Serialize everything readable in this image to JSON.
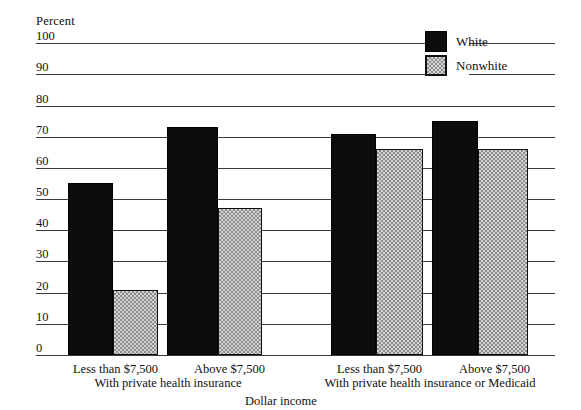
{
  "chart_data": {
    "type": "bar",
    "title": "",
    "subtitle": "",
    "xlabel": "Dollar income",
    "ylabel": "Percent",
    "ylim": [
      0,
      100
    ],
    "yticks": [
      100,
      90,
      80,
      70,
      60,
      50,
      40,
      30,
      20,
      10,
      0
    ],
    "ytick_labels": [
      "100",
      "90",
      "80",
      "70",
      "60",
      "50",
      "40",
      "30",
      "20",
      "10",
      "0"
    ],
    "grid": "horizontal",
    "legend_position": "top-right",
    "categories": [
      "Less than $7,500",
      "Above $7,500",
      "Less than $7,500",
      "Above $7,500"
    ],
    "groups": [
      {
        "label": "With private health insurance",
        "categories": [
          "Less than $7,500",
          "Above $7,500"
        ]
      },
      {
        "label": "With private health insurance or Medicaid",
        "categories": [
          "Less than $7,500",
          "Above $7,500"
        ]
      }
    ],
    "series": [
      {
        "name": "White",
        "color": "#0d0d0d",
        "pattern": "solid",
        "values": [
          55,
          73,
          71,
          75
        ]
      },
      {
        "name": "Nonwhite",
        "color": "#d2d2d2",
        "pattern": "checkered",
        "values": [
          21,
          47,
          66,
          66
        ]
      }
    ]
  },
  "legend": {
    "items": [
      {
        "label": "White",
        "swatch": "solid-black-swatch"
      },
      {
        "label": "Nonwhite",
        "swatch": "checkered-gray-swatch"
      }
    ]
  },
  "axis": {
    "y_title": "Percent",
    "x_title": "Dollar income"
  }
}
